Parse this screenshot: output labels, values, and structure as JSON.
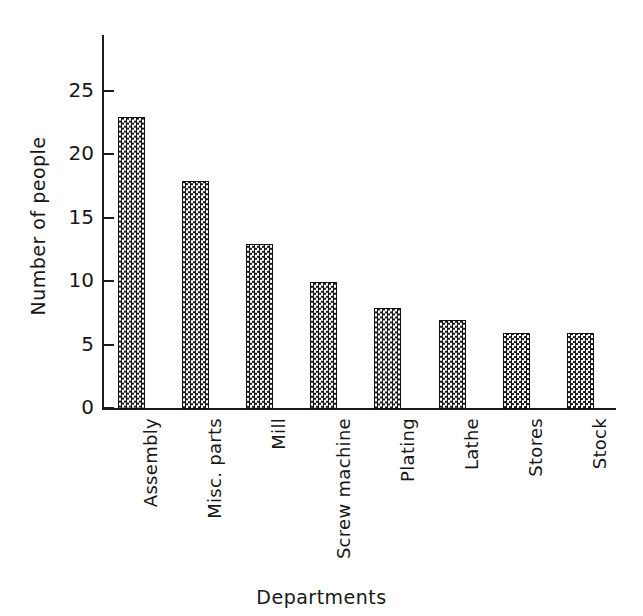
{
  "chart_data": {
    "type": "bar",
    "title": "",
    "subtitle": "",
    "xlabel": "Departments",
    "ylabel": "Number of people",
    "categories": [
      "Assembly",
      "Misc. parts",
      "Mill",
      "Screw machine",
      "Plating",
      "Lathe",
      "Stores",
      "Stock"
    ],
    "values": [
      23,
      18,
      13,
      10,
      8,
      7,
      6,
      6
    ],
    "ylim": [
      0,
      25
    ],
    "yticks": [
      0,
      5,
      10,
      15,
      20,
      25
    ],
    "ytick_labels": [
      "0",
      "5",
      "10",
      "15",
      "20",
      "25"
    ],
    "grid": false,
    "legend": false,
    "legend_position": "none",
    "bar_fill": "checkered-halftone",
    "bar_edge_color": "#111111",
    "axis_color": "#1b1b1b",
    "background_color": "#ffffff"
  },
  "axes": {
    "y_axis_title": "Number of people",
    "x_axis_title": "Departments"
  }
}
